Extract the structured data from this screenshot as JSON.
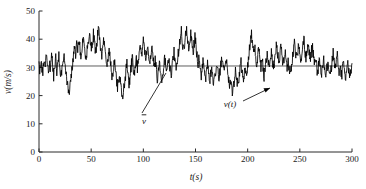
{
  "chart_data": {
    "type": "line",
    "title": "",
    "subtitle": "",
    "xlabel": "t(s)",
    "ylabel": "v(m/s)",
    "xlim": [
      0,
      300
    ],
    "ylim": [
      0,
      50
    ],
    "xticks": [
      0,
      50,
      100,
      150,
      200,
      250,
      300
    ],
    "yticks": [
      0,
      10,
      20,
      30,
      40,
      50
    ],
    "xtick_labels": [
      "0",
      "50",
      "100",
      "150",
      "200",
      "250",
      "300"
    ],
    "ytick_labels": [
      "0",
      "10",
      "20",
      "30",
      "40",
      "50"
    ],
    "grid": false,
    "legend": "none",
    "line_color": "#000000",
    "mean_line_color": "#4d4d4d",
    "annotations": [
      {
        "name": "mean-line-label",
        "text": "v",
        "overbar": true,
        "x": 150,
        "y": 15
      },
      {
        "name": "signal-label",
        "text": "v(t)",
        "overbar": false,
        "x": 205,
        "y": 19
      }
    ],
    "series": [
      {
        "name": "v_mean",
        "type": "horizontal-line",
        "value": 30.5
      },
      {
        "name": "v(t)",
        "type": "line",
        "x_step": 1,
        "values": [
          31.5,
          28.0,
          33.5,
          27.0,
          30.0,
          33.0,
          29.5,
          35.0,
          30.5,
          27.5,
          32.0,
          29.0,
          34.5,
          31.0,
          27.0,
          30.5,
          33.5,
          29.0,
          31.5,
          34.0,
          30.0,
          26.5,
          29.5,
          33.0,
          35.5,
          31.0,
          28.0,
          24.5,
          22.0,
          20.5,
          24.0,
          27.5,
          31.0,
          34.5,
          37.5,
          35.0,
          38.5,
          36.0,
          39.5,
          37.0,
          34.0,
          36.5,
          40.0,
          38.0,
          35.5,
          33.0,
          36.0,
          39.5,
          42.5,
          40.0,
          37.0,
          39.0,
          42.0,
          38.5,
          35.0,
          38.0,
          41.5,
          43.0,
          39.5,
          36.0,
          33.5,
          36.5,
          40.0,
          37.5,
          34.0,
          31.0,
          33.5,
          36.0,
          32.5,
          29.0,
          26.5,
          29.5,
          32.0,
          28.5,
          25.5,
          23.0,
          25.5,
          28.0,
          24.5,
          21.5,
          20.0,
          22.5,
          25.0,
          28.5,
          31.0,
          27.5,
          24.0,
          26.5,
          30.0,
          33.5,
          30.5,
          27.0,
          30.0,
          33.0,
          29.5,
          32.5,
          36.0,
          38.5,
          35.0,
          37.5,
          40.0,
          36.5,
          33.0,
          35.5,
          38.0,
          34.5,
          31.5,
          34.0,
          37.0,
          33.5,
          30.0,
          32.5,
          29.0,
          26.0,
          28.5,
          31.0,
          27.5,
          24.5,
          27.0,
          30.0,
          33.5,
          30.5,
          28.0,
          31.0,
          34.0,
          30.5,
          27.5,
          30.0,
          33.0,
          35.5,
          32.0,
          29.0,
          31.5,
          34.5,
          38.0,
          40.5,
          43.0,
          39.5,
          36.0,
          38.5,
          41.5,
          43.5,
          40.0,
          37.0,
          39.5,
          42.0,
          38.5,
          35.5,
          38.0,
          41.0,
          37.5,
          34.0,
          31.0,
          33.5,
          30.0,
          27.0,
          29.5,
          32.5,
          29.0,
          26.0,
          28.5,
          31.5,
          28.0,
          25.0,
          27.5,
          30.0,
          26.5,
          24.0,
          26.5,
          29.5,
          32.0,
          29.0,
          26.0,
          28.5,
          31.5,
          34.0,
          30.5,
          27.5,
          30.0,
          33.0,
          29.5,
          26.5,
          24.0,
          26.0,
          23.5,
          21.0,
          23.5,
          26.5,
          29.0,
          26.0,
          23.5,
          26.0,
          29.0,
          31.5,
          28.0,
          25.5,
          28.0,
          30.5,
          27.5,
          30.0,
          33.0,
          36.0,
          38.5,
          42.0,
          38.5,
          35.0,
          37.5,
          34.5,
          31.5,
          34.0,
          37.0,
          33.5,
          30.5,
          33.0,
          30.0,
          27.0,
          29.5,
          32.5,
          35.5,
          32.0,
          29.5,
          32.0,
          35.0,
          32.5,
          29.5,
          32.5,
          35.5,
          38.5,
          35.0,
          32.0,
          34.5,
          37.5,
          34.0,
          31.0,
          33.5,
          36.5,
          33.0,
          30.0,
          32.5,
          29.5,
          27.0,
          29.5,
          32.5,
          35.5,
          38.5,
          35.5,
          32.5,
          35.0,
          38.0,
          34.5,
          31.5,
          34.0,
          37.0,
          40.0,
          36.5,
          33.5,
          36.0,
          39.0,
          35.5,
          32.5,
          35.0,
          38.0,
          34.5,
          31.5,
          34.0,
          31.0,
          28.0,
          30.5,
          33.5,
          30.0,
          27.5,
          30.0,
          33.0,
          30.0,
          27.0,
          29.5,
          32.5,
          29.5,
          26.5,
          29.0,
          32.0,
          35.0,
          31.5,
          28.5,
          31.0,
          34.0,
          30.5,
          27.5,
          30.0,
          27.0,
          29.5,
          32.5,
          29.5,
          26.5,
          29.0,
          32.0,
          29.0,
          26.0,
          28.5,
          31.5
        ]
      }
    ],
    "notes": {
      "mean_value": 30.5,
      "max_value": 48.0,
      "min_value": 16.0,
      "sampling": "1 s over 0-300 s, turbulent wind speed record"
    }
  },
  "axes": {
    "x_label": "t(s)",
    "y_label": "v(m/s)"
  }
}
